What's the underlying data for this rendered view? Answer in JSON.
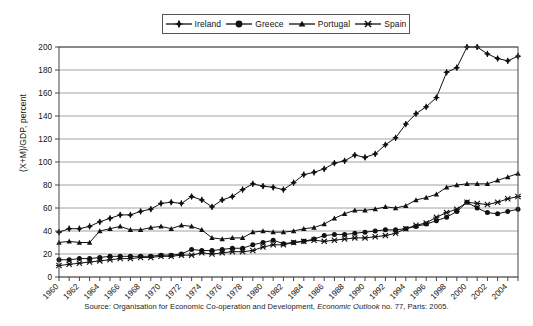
{
  "legend": {
    "position": "top-center",
    "items": [
      {
        "label": "Ireland",
        "marker": "diamond-plus-marker",
        "color": "#111111"
      },
      {
        "label": "Greece",
        "marker": "filled-circle-marker",
        "color": "#111111"
      },
      {
        "label": "Portugal",
        "marker": "filled-triangle-marker",
        "color": "#111111"
      },
      {
        "label": "Spain",
        "marker": "x-cross-marker",
        "color": "#111111"
      }
    ]
  },
  "source": {
    "prefix": "Source: Organisation for Economic Co-operation and Development, ",
    "italic": "Economic Outlook",
    "suffix": " no. 77, Paris: 2005."
  },
  "chart_data": {
    "type": "line",
    "title": "",
    "subtitle": "",
    "xlabel": "",
    "ylabel": "(X+M)/GDP, percent",
    "ylim": [
      0,
      200
    ],
    "ytick_step": 20,
    "yticks": [
      0,
      20,
      40,
      60,
      80,
      100,
      120,
      140,
      160,
      180,
      200
    ],
    "xlim": [
      1960,
      2005
    ],
    "xticks": [
      1960,
      1961,
      1962,
      1963,
      1964,
      1965,
      1966,
      1967,
      1968,
      1969,
      1970,
      1971,
      1972,
      1973,
      1974,
      1975,
      1976,
      1977,
      1978,
      1979,
      1980,
      1981,
      1982,
      1983,
      1984,
      1985,
      1986,
      1987,
      1988,
      1989,
      1990,
      1991,
      1992,
      1993,
      1994,
      1995,
      1996,
      1997,
      1998,
      1999,
      2000,
      2001,
      2002,
      2003,
      2004,
      2005
    ],
    "xtick_labels": [
      1960,
      1962,
      1964,
      1966,
      1968,
      1970,
      1972,
      1974,
      1976,
      1978,
      1980,
      1982,
      1984,
      1986,
      1988,
      1990,
      1992,
      1994,
      1996,
      1998,
      2000,
      2002,
      2004
    ],
    "xtick_label_rotation": -45,
    "grid": "horizontal",
    "legend_position": "top-center",
    "x": [
      1960,
      1961,
      1962,
      1963,
      1964,
      1965,
      1966,
      1967,
      1968,
      1969,
      1970,
      1971,
      1972,
      1973,
      1974,
      1975,
      1976,
      1977,
      1978,
      1979,
      1980,
      1981,
      1982,
      1983,
      1984,
      1985,
      1986,
      1987,
      1988,
      1989,
      1990,
      1991,
      1992,
      1993,
      1994,
      1995,
      1996,
      1997,
      1998,
      1999,
      2000,
      2001,
      2002,
      2003,
      2004,
      2005
    ],
    "series": [
      {
        "name": "Ireland",
        "marker": "diamond-plus-marker",
        "color": "#111111",
        "values": [
          39,
          42,
          42,
          44,
          48,
          51,
          54,
          54,
          57,
          59,
          64,
          65,
          64,
          70,
          67,
          61,
          67,
          70,
          76,
          81,
          79,
          78,
          76,
          82,
          89,
          91,
          94,
          99,
          101,
          106,
          104,
          107,
          115,
          121,
          133,
          142,
          148,
          156,
          178,
          182,
          200,
          200,
          194,
          190,
          188,
          192
        ]
      },
      {
        "name": "Greece",
        "marker": "filled-circle-marker",
        "color": "#111111",
        "values": [
          15,
          15,
          16,
          16,
          17,
          18,
          18,
          18,
          18,
          18,
          19,
          19,
          20,
          24,
          23,
          23,
          24,
          25,
          25,
          28,
          30,
          32,
          29,
          30,
          31,
          33,
          36,
          37,
          37,
          38,
          39,
          40,
          41,
          41,
          42,
          44,
          46,
          49,
          52,
          57,
          65,
          60,
          56,
          55,
          57,
          59
        ]
      },
      {
        "name": "Portugal",
        "marker": "filled-triangle-marker",
        "color": "#111111",
        "values": [
          30,
          31,
          30,
          30,
          40,
          42,
          44,
          41,
          41,
          43,
          44,
          42,
          45,
          44,
          41,
          34,
          33,
          34,
          34,
          39,
          40,
          39,
          39,
          40,
          42,
          43,
          46,
          51,
          55,
          58,
          58,
          59,
          61,
          60,
          62,
          67,
          69,
          72,
          78,
          80,
          81,
          81,
          81,
          84,
          87,
          90
        ]
      },
      {
        "name": "Spain",
        "marker": "x-cross-marker",
        "color": "#111111",
        "values": [
          10,
          11,
          12,
          13,
          14,
          15,
          16,
          16,
          17,
          17,
          18,
          18,
          19,
          19,
          21,
          20,
          21,
          22,
          22,
          23,
          26,
          28,
          28,
          30,
          31,
          32,
          31,
          32,
          33,
          34,
          34,
          35,
          36,
          38,
          42,
          45,
          47,
          52,
          56,
          59,
          65,
          64,
          63,
          65,
          68,
          70
        ]
      }
    ]
  }
}
